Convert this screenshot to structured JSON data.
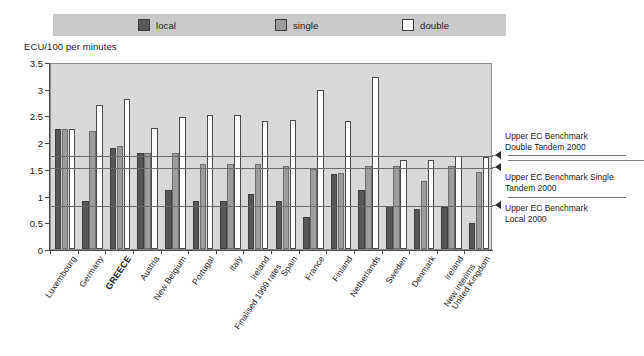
{
  "legend": {
    "items": [
      {
        "label": "local",
        "color": "#575757",
        "name": "legend-swatch-local"
      },
      {
        "label": "single",
        "color": "#9d9d9d",
        "name": "legend-swatch-single"
      },
      {
        "label": "double",
        "color": "#ffffff",
        "name": "legend-swatch-double"
      }
    ]
  },
  "annotations": [
    {
      "id": "double-tandem",
      "line1": "Upper EC Benchmark",
      "line2": "Double Tandem 2000",
      "value": 1.78
    },
    {
      "id": "single-tandem",
      "line1": "Upper EC Benchmark Single",
      "line2": "Tandem 2000",
      "value": 1.55
    },
    {
      "id": "local",
      "line1": "Upper EC Benchmark",
      "line2": "Local 2000",
      "value": 0.84
    }
  ],
  "chart_data": {
    "type": "bar",
    "title": "",
    "xlabel": "",
    "ylabel": "ECU/100 per minutes",
    "ylim": [
      0,
      3.5
    ],
    "ytick_labels": [
      "0",
      "0.5",
      "1",
      "1.5",
      "2",
      "2.5",
      "3",
      "3.5"
    ],
    "ytick_values": [
      0,
      0.5,
      1,
      1.5,
      2,
      2.5,
      3,
      3.5
    ],
    "grid": false,
    "legend_position": "top",
    "categories": [
      "Luxembourg",
      "Germany",
      "GREECE",
      "Austria",
      "New Belgium",
      "Portugal",
      "Italy",
      "Ireland",
      "Spain",
      "France",
      "Finland",
      "Netherlands",
      "Sweden",
      "Denmark",
      "Ireland",
      "United Kingdom"
    ],
    "category_notes": [
      "",
      "",
      "",
      "",
      "",
      "",
      "",
      "Finalised 1999 rates",
      "",
      "",
      "",
      "",
      "",
      "",
      "New interims",
      ""
    ],
    "category_bold": [
      false,
      false,
      true,
      false,
      false,
      false,
      false,
      false,
      false,
      false,
      false,
      false,
      false,
      false,
      false,
      false
    ],
    "series": [
      {
        "name": "local",
        "color": "#575757",
        "values": [
          2.25,
          0.9,
          1.9,
          1.8,
          1.1,
          0.9,
          0.9,
          1.03,
          0.9,
          0.6,
          1.4,
          1.1,
          0.8,
          0.74,
          0.78,
          0.48
        ]
      },
      {
        "name": "single",
        "color": "#9d9d9d",
        "values": [
          2.25,
          2.2,
          1.92,
          1.8,
          1.8,
          1.6,
          1.6,
          1.6,
          1.55,
          1.5,
          1.42,
          1.55,
          1.55,
          1.27,
          1.55,
          1.45
        ]
      },
      {
        "name": "double",
        "color": "#ffffff",
        "values": [
          2.25,
          2.7,
          2.8,
          2.27,
          2.48,
          2.5,
          2.5,
          2.4,
          2.42,
          2.97,
          2.4,
          3.22,
          1.67,
          1.67,
          1.75,
          1.72
        ]
      }
    ]
  }
}
